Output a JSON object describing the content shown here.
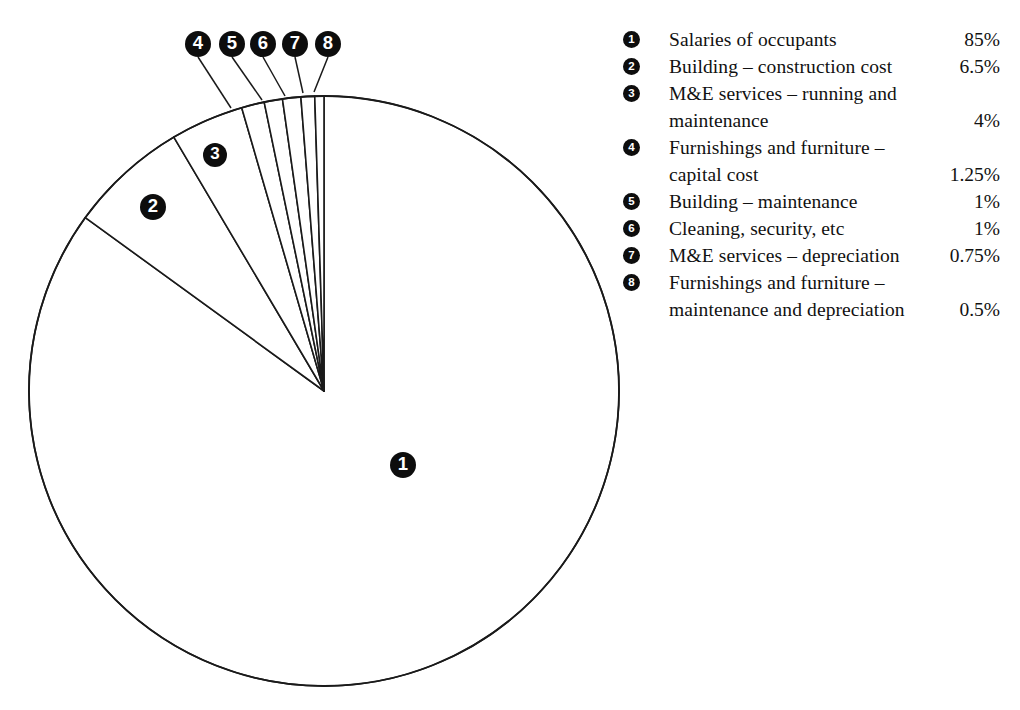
{
  "chart_data": {
    "type": "pie",
    "title": "",
    "subtitle": "",
    "xlabel": "",
    "ylabel": "",
    "grid": false,
    "legend_position": "right",
    "value_unit": "%",
    "total": 100,
    "start_angle_deg": 0,
    "direction": "clockwise",
    "categories": [
      "Salaries of occupants",
      "Building – construction cost",
      "M&E services – running and maintenance",
      "Furnishings and furniture – capital cost",
      "Building – maintenance",
      "Cleaning, security, etc",
      "M&E services – depreciation",
      "Furnishings and furniture – maintenance and depreciation"
    ],
    "values": [
      85,
      6.5,
      4,
      1.25,
      1,
      1,
      0.75,
      0.5
    ],
    "value_labels": [
      "85%",
      "6.5%",
      "4%",
      "1.25%",
      "1%",
      "1%",
      "0.75%",
      "0.5%"
    ],
    "slice_markers": [
      "1",
      "2",
      "3",
      "4",
      "5",
      "6",
      "7",
      "8"
    ]
  },
  "pie": {
    "center_x": 324,
    "center_y": 391,
    "radius": 295,
    "stroke_color": "#1a1a1a",
    "fill_color": "#ffffff",
    "badge_fill": "#0d0d0d",
    "badge_text_color": "#ffffff",
    "inside_badges": [
      {
        "id": "1",
        "label": "1",
        "x": 403,
        "y": 465,
        "r": 13
      },
      {
        "id": "2",
        "label": "2",
        "x": 153,
        "y": 207,
        "r": 13
      },
      {
        "id": "3",
        "label": "3",
        "x": 215,
        "y": 155,
        "r": 12
      }
    ],
    "callout_badges": [
      {
        "id": "4",
        "label": "4",
        "x": 198,
        "y": 44,
        "r": 13,
        "leader_to_x": 231,
        "leader_to_y": 108
      },
      {
        "id": "5",
        "label": "5",
        "x": 232,
        "y": 44,
        "r": 13,
        "leader_to_x": 262,
        "leader_to_y": 100
      },
      {
        "id": "6",
        "label": "6",
        "x": 263,
        "y": 44,
        "r": 13,
        "leader_to_x": 285,
        "leader_to_y": 96
      },
      {
        "id": "7",
        "label": "7",
        "x": 295,
        "y": 44,
        "r": 13,
        "leader_to_x": 303,
        "leader_to_y": 93
      },
      {
        "id": "8",
        "label": "8",
        "x": 328,
        "y": 44,
        "r": 13,
        "leader_to_x": 314,
        "leader_to_y": 92
      }
    ]
  },
  "legend": {
    "rows": [
      {
        "marker": "1",
        "label": "Salaries of occupants",
        "value": "85%",
        "continuation": ""
      },
      {
        "marker": "2",
        "label": "Building – construction cost",
        "value": "6.5%",
        "continuation": ""
      },
      {
        "marker": "3",
        "label": "M&E services – running and",
        "value": "",
        "continuation": ""
      },
      {
        "marker": "",
        "label": "maintenance",
        "value": "4%",
        "continuation": "yes"
      },
      {
        "marker": "4",
        "label": "Furnishings and furniture –",
        "value": "",
        "continuation": ""
      },
      {
        "marker": "",
        "label": "capital cost",
        "value": "1.25%",
        "continuation": "yes"
      },
      {
        "marker": "5",
        "label": "Building – maintenance",
        "value": "1%",
        "continuation": ""
      },
      {
        "marker": "6",
        "label": "Cleaning, security, etc",
        "value": "1%",
        "continuation": ""
      },
      {
        "marker": "7",
        "label": "M&E services – depreciation",
        "value": "0.75%",
        "continuation": ""
      },
      {
        "marker": "8",
        "label": "Furnishings and furniture –",
        "value": "",
        "continuation": ""
      },
      {
        "marker": "",
        "label": "maintenance and depreciation",
        "value": "0.5%",
        "continuation": "yes"
      }
    ]
  }
}
